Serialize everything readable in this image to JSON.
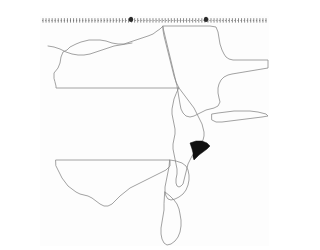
{
  "figure": {
    "kind": "choropleth-locator-map",
    "title": "Mid-Atlantic United States locator map",
    "caption": "",
    "width": 229,
    "height": 230,
    "background_color": "#fdfdfd",
    "outline_color": "#8a8a8a",
    "highlight_color": "#111111",
    "frame_color": "#8f8f8f"
  },
  "legend": {
    "visible": false,
    "entries": []
  },
  "labels": {
    "visible": false,
    "items": []
  },
  "frame": {
    "top_border_style": "dashed",
    "tick_count": 74,
    "markers": [
      {
        "name": "top-marker-left",
        "x_px": 91
      },
      {
        "name": "top-marker-right",
        "x_px": 166
      }
    ]
  },
  "regions": [
    {
      "name": "pennsylvania",
      "label": "Pennsylvania",
      "highlighted": false,
      "path": "M 14 62 L 14 57 L 18 52 L 20 47 L 21 41 L 23 36 L 27 34 L 30 31 L 36 28 L 41 26 L 45 25 L 49 24 L 54 24 L 60 24 L 66 25 L 72 27 L 78 28 L 84 28 L 90 26 L 96 24 L 102 22 L 108 20 L 113 18 L 117 15 L 120 13 L 122 11 L 123 10 L 123 14 L 124 20 L 126 28 L 128 36 L 130 44 L 132 52 L 134 60 L 136 66 L 138 70 L 139 72 L 136 72 L 130 72 L 122 72 L 112 72 L 100 72 L 88 72 L 76 72 L 64 72 L 52 72 L 40 72 L 30 72 L 22 72 L 18 72 L 16 72 L 16 70 L 15 66 Z"
    },
    {
      "name": "new-jersey",
      "label": "New Jersey",
      "highlighted": false,
      "path": "M 139 72 L 142 76 L 145 80 L 148 84 L 151 88 L 154 92 L 156 96 L 158 100 L 160 104 L 162 108 L 163 112 L 164 116 L 164 120 L 163 124 L 161 128 L 158 132 L 155 136 L 152 140 L 150 144 L 148 148 L 147 152 L 146 156 L 145 160 L 144 164 L 143 168 L 141 170 L 139 171 L 137 170 L 136 167 L 136 163 L 137 158 L 137 153 L 136 148 L 135 143 L 134 138 L 133 133 L 133 128 L 134 123 L 135 118 L 135 113 L 134 108 L 133 103 L 132 98 L 132 93 L 133 88 L 134 83 L 136 78 Z"
    },
    {
      "name": "new-york",
      "label": "New York",
      "highlighted": false,
      "path": "M 123 10 L 130 10 L 140 10 L 150 10 L 160 10 L 170 10 L 176 11 L 178 16 L 179 22 L 180 28 L 182 34 L 184 38 L 186 41 L 189 43 L 193 44 L 198 44 L 204 44 L 210 44 L 216 44 L 222 44 L 228 44 L 228 52 L 222 53 L 216 54 L 210 55 L 204 56 L 198 57 L 192 58 L 188 59 L 184 61 L 181 64 L 179 68 L 178 72 L 178 77 L 179 82 L 180 86 L 178 90 L 174 92 L 170 93 L 166 94 L 162 96 L 158 98 L 154 100 L 150 101 L 146 100 L 143 97 L 141 93 L 140 88 L 139 82 L 138 76 L 137 70 Z"
    },
    {
      "name": "long-island",
      "label": "Long Island",
      "highlighted": false,
      "path": "M 172 98 L 178 97 L 186 96 L 194 95 L 202 95 L 210 95 L 218 96 L 226 98 L 228 100 L 222 101 L 214 102 L 206 103 L 198 104 L 190 105 L 182 106 L 176 106 L 172 104 Z"
    },
    {
      "name": "maryland",
      "label": "Maryland",
      "highlighted": false,
      "path": "M 16 144 L 24 144 L 34 144 L 44 144 L 54 144 L 64 144 L 74 144 L 84 144 L 94 144 L 104 144 L 114 144 L 124 144 L 130 144 L 130 150 L 126 154 L 120 157 L 114 160 L 108 163 L 102 166 L 96 169 L 90 172 L 85 176 L 80 180 L 76 184 L 72 188 L 68 190 L 64 190 L 60 188 L 56 185 L 52 182 L 48 180 L 44 179 L 40 178 L 36 176 L 32 173 L 28 170 L 25 166 L 22 162 L 20 158 L 18 154 L 16 150 Z"
    },
    {
      "name": "delaware",
      "label": "Delaware",
      "highlighted": false,
      "path": "M 130 144 L 136 145 L 142 147 L 146 150 L 148 154 L 149 159 L 149 164 L 148 169 L 146 174 L 143 178 L 139 181 L 135 183 L 131 184 L 128 183 L 126 180 L 125 176 L 125 171 L 126 166 L 127 161 L 128 156 L 129 151 Z"
    },
    {
      "name": "delmarva-peninsula",
      "label": "Delmarva Peninsula",
      "highlighted": false,
      "path": "M 125 176 L 130 180 L 134 184 L 137 188 L 139 193 L 140 198 L 141 204 L 141 210 L 140 216 L 138 221 L 135 225 L 131 228 L 127 229 L 124 227 L 122 223 L 121 218 L 121 212 L 122 206 L 123 200 L 124 194 L 124 188 Z"
    },
    {
      "name": "lake-erie-shore",
      "label": "Lake Erie shoreline",
      "highlighted": false,
      "path": "M 8 30 L 14 31 L 20 33 L 26 36 L 32 38 L 38 39 L 44 39 L 50 38 L 56 36 L 62 34 L 68 32 L 74 30 L 80 29 L 86 28 L 92 27"
    },
    {
      "name": "middlesex-county-new-jersey",
      "label": "Highlighted county",
      "highlighted": true,
      "path": "M 150 127 L 156 125 L 162 125 L 167 127 L 170 130 L 167 133 L 163 136 L 159 139 L 156 142 L 154 144 L 153 141 L 153 137 L 152 133 Z"
    }
  ]
}
